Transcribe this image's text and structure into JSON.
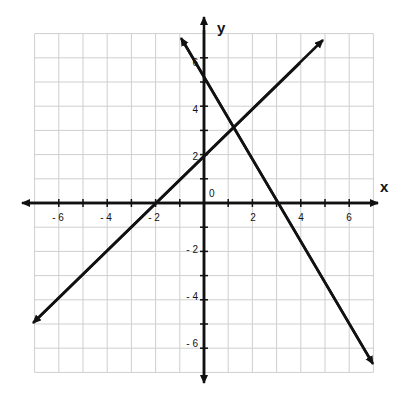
{
  "chart_data": {
    "type": "line",
    "title": "",
    "xlabel": "x",
    "ylabel": "y",
    "xlim": [
      -7,
      7
    ],
    "ylim": [
      -7,
      7
    ],
    "grid": true,
    "x_ticks": [
      -6,
      -4,
      -2,
      2,
      4,
      6
    ],
    "y_ticks": [
      -6,
      -4,
      -2,
      2,
      4,
      6
    ],
    "x_tick_labels": [
      "- 6",
      "- 4",
      "- 2",
      "2",
      "4",
      "6"
    ],
    "y_tick_labels": [
      "- 6",
      "- 4",
      "- 2",
      "2",
      "4",
      "6"
    ],
    "origin_label": "0",
    "series": [
      {
        "name": "line-1",
        "equation": "y = x + 2",
        "points": [
          [
            -7,
            -5
          ],
          [
            -2,
            0
          ],
          [
            0,
            2
          ],
          [
            5,
            7
          ]
        ],
        "arrows": "both"
      },
      {
        "name": "line-2",
        "equation": "y = -1.8x + 5.4",
        "points": [
          [
            -1,
            7.2
          ],
          [
            0,
            5.4
          ],
          [
            3,
            0
          ],
          [
            7,
            -7.2
          ]
        ],
        "arrows": "both"
      }
    ],
    "intersection": [
      1.2,
      3.2
    ]
  },
  "labels": {
    "x_axis": "x",
    "y_axis": "y",
    "origin": "0",
    "xt": [
      "- 6",
      "- 4",
      "- 2",
      "2",
      "4",
      "6"
    ],
    "yt": [
      "6",
      "4",
      "2",
      "- 2",
      "- 4",
      "- 6"
    ]
  }
}
